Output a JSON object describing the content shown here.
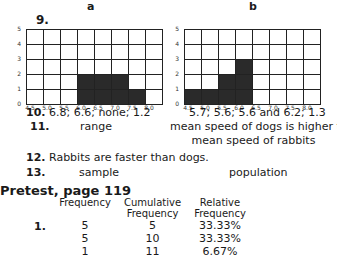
{
  "charts": {
    "a": {
      "label": "a"
    },
    "b": {
      "label": "b"
    }
  },
  "chart_data": [
    {
      "type": "bar",
      "title": "a",
      "categories": [
        "4.5",
        "5.0",
        "5.5",
        "6.0",
        "6.5",
        "7.0",
        "7.5",
        "8.0"
      ],
      "values": [
        0,
        0,
        0,
        2,
        2,
        2,
        1,
        0
      ],
      "yticks": [
        0,
        1,
        2,
        3,
        4,
        5
      ],
      "ylim": [
        0,
        5
      ],
      "grid": true
    },
    {
      "type": "bar",
      "title": "b",
      "categories": [
        "4.5",
        "5.0",
        "5.5",
        "6.0",
        "6.5",
        "7.0",
        "7.5",
        "8.0"
      ],
      "values": [
        1,
        1,
        2,
        3,
        0,
        0,
        0,
        0
      ],
      "yticks": [
        0,
        1,
        2,
        3,
        4,
        5
      ],
      "ylim": [
        0,
        5
      ],
      "grid": true
    }
  ],
  "answers": {
    "q9": "9.",
    "q10": {
      "num": "10.",
      "a": "6.8; 6.6; none; 1.2",
      "b": "5.7; 5.6; 5.6 and 6.2; 1.3"
    },
    "q11": {
      "num": "11.",
      "a": "range",
      "b_line1": "mean speed of dogs is higher than",
      "b_line2": "mean speed of rabbits"
    },
    "q12": {
      "num": "12.",
      "text": "Rabbits are faster than dogs."
    },
    "q13": {
      "num": "13.",
      "a": "sample",
      "b": "population"
    }
  },
  "pretest": {
    "heading": "Pretest, page 119",
    "item": "1.",
    "headers": {
      "freq": "Frequency",
      "cum1": "Cumulative",
      "cum2": "Frequency",
      "rel1": "Relative",
      "rel2": "Frequency"
    },
    "rows": [
      {
        "freq": "5",
        "cum": "5",
        "rel": "33.33%"
      },
      {
        "freq": "5",
        "cum": "10",
        "rel": "33.33%"
      },
      {
        "freq": "1",
        "cum": "11",
        "rel": "6.67%"
      }
    ]
  }
}
